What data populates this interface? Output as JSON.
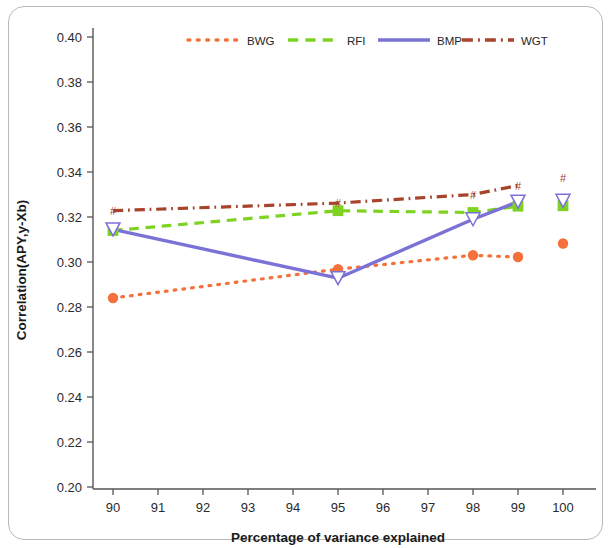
{
  "chart_data": {
    "type": "line",
    "title": "",
    "xlabel": "Percentage of variance explained",
    "ylabel": "Correlation(APY,y-Xb)",
    "xlim": [
      89.5,
      100.5
    ],
    "ylim": [
      0.2,
      0.41
    ],
    "xticks": [
      90,
      91,
      92,
      93,
      94,
      95,
      96,
      97,
      98,
      99,
      100
    ],
    "yticks": [
      0.2,
      0.22,
      0.24,
      0.26,
      0.28,
      0.3,
      0.32,
      0.34,
      0.36,
      0.38,
      0.4
    ],
    "xtick_labels": [
      "90",
      "91",
      "92",
      "93",
      "94",
      "95",
      "96",
      "97",
      "98",
      "99",
      "100"
    ],
    "ytick_labels": [
      "0.20",
      "0.22",
      "0.24",
      "0.26",
      "0.28",
      "0.30",
      "0.32",
      "0.34",
      "0.36",
      "0.38",
      "0.40"
    ],
    "grid": false,
    "legend_position": "top-center",
    "x": [
      90,
      95,
      98,
      99,
      100
    ],
    "x_connected": [
      90,
      95,
      98,
      99
    ],
    "x_isolated": [
      100
    ],
    "series": [
      {
        "name": "BWG",
        "color": "#f4713b",
        "linestyle": "dotted",
        "marker": "circle",
        "values": [
          0.284,
          0.2968,
          0.303,
          0.3022,
          0.3082
        ]
      },
      {
        "name": "RFI",
        "color": "#7ed321",
        "linestyle": "dashed",
        "marker": "square",
        "values": [
          0.314,
          0.3228,
          0.322,
          0.3248,
          0.325
        ]
      },
      {
        "name": "BMP",
        "color": "#7b72d6",
        "linestyle": "solid",
        "marker": "triangle-down",
        "values": [
          0.3145,
          0.2928,
          0.319,
          0.3268,
          0.3272
        ]
      },
      {
        "name": "WGT",
        "color": "#a8432c",
        "linestyle": "dashdot",
        "marker": "hash",
        "values": [
          0.3228,
          0.3262,
          0.33,
          0.334,
          0.3372
        ]
      }
    ]
  },
  "legend": {
    "entries": [
      {
        "label": "BWG"
      },
      {
        "label": "RFI"
      },
      {
        "label": "BMP"
      },
      {
        "label": "WGT"
      }
    ]
  },
  "axes": {
    "x_title": "Percentage of variance explained",
    "y_title": "Correlation(APY,y-Xb)"
  }
}
